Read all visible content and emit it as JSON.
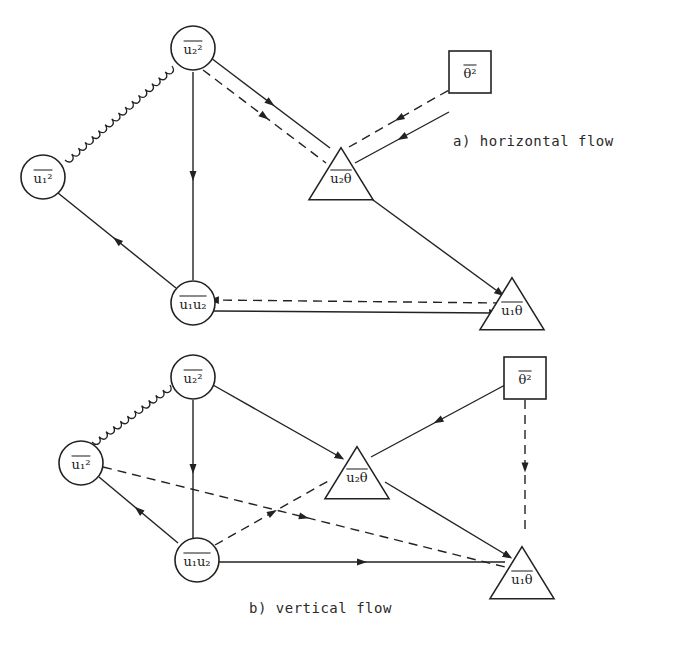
{
  "diagrams": [
    {
      "id": "a",
      "caption": "a) horizontal flow",
      "nodes": [
        {
          "key": "u2sq",
          "shape": "circle",
          "label": "u",
          "sub": "2",
          "sup": "2",
          "x": 193,
          "y": 48
        },
        {
          "key": "u1sq",
          "shape": "circle",
          "label": "u",
          "sub": "1",
          "sup": "2",
          "x": 43,
          "y": 177
        },
        {
          "key": "u1u2",
          "shape": "circle",
          "label": "u₁u₂",
          "sub": "",
          "sup": "",
          "x": 193,
          "y": 303
        },
        {
          "key": "u2theta",
          "shape": "triangle",
          "label": "u₂θ",
          "sub": "",
          "sup": "",
          "x": 341,
          "y": 173
        },
        {
          "key": "u1theta",
          "shape": "triangle",
          "label": "u₁θ",
          "sub": "",
          "sup": "",
          "x": 512,
          "y": 303
        },
        {
          "key": "thetasq",
          "shape": "square",
          "label": "θ",
          "sub": "",
          "sup": "2",
          "x": 470,
          "y": 72
        }
      ]
    },
    {
      "id": "b",
      "caption": "b) vertical flow",
      "nodes": [
        {
          "key": "u2sq",
          "shape": "circle",
          "label": "u",
          "sub": "2",
          "sup": "2",
          "x": 193,
          "y": 377
        },
        {
          "key": "u1sq",
          "shape": "circle",
          "label": "u",
          "sub": "1",
          "sup": "2",
          "x": 81,
          "y": 463
        },
        {
          "key": "u1u2",
          "shape": "circle",
          "label": "u₁u₂",
          "sub": "",
          "sup": "",
          "x": 197,
          "y": 560
        },
        {
          "key": "u2theta",
          "shape": "triangle",
          "label": "u₂θ",
          "sub": "",
          "sup": "",
          "x": 357,
          "y": 472
        },
        {
          "key": "u1theta",
          "shape": "triangle",
          "label": "u₁θ",
          "sub": "",
          "sup": "",
          "x": 522,
          "y": 572
        },
        {
          "key": "thetasq",
          "shape": "square",
          "label": "θ",
          "sub": "",
          "sup": "2",
          "x": 525,
          "y": 378
        }
      ]
    }
  ],
  "edges_a": [
    {
      "from": [
        65,
        160
      ],
      "to": [
        172,
        66
      ],
      "style": "wavy",
      "arrow": false
    },
    {
      "from": [
        193,
        72
      ],
      "to": [
        193,
        280
      ],
      "style": "solid",
      "arrow": "mid"
    },
    {
      "from": [
        58,
        193
      ],
      "to": [
        176,
        288
      ],
      "style": "solid",
      "arrow": "mid-reverse"
    },
    {
      "from": [
        211,
        58
      ],
      "to": [
        330,
        148
      ],
      "style": "solid",
      "arrow": "mid"
    },
    {
      "from": [
        203,
        70
      ],
      "to": [
        326,
        163
      ],
      "style": "dashed",
      "arrow": "mid"
    },
    {
      "from": [
        349,
        147
      ],
      "to": [
        449,
        90
      ],
      "style": "dashed",
      "arrow": "mid-reverse"
    },
    {
      "from": [
        355,
        163
      ],
      "to": [
        449,
        112
      ],
      "style": "solid",
      "arrow": "mid-reverse"
    },
    {
      "from": [
        358,
        189
      ],
      "to": [
        500,
        293
      ],
      "style": "solid",
      "arrow": "end"
    },
    {
      "from": [
        502,
        303
      ],
      "to": [
        214,
        300
      ],
      "style": "dashed",
      "arrow": "end"
    },
    {
      "from": [
        214,
        311
      ],
      "to": [
        494,
        313
      ],
      "style": "solid",
      "arrow": "end"
    }
  ],
  "edges_b": [
    {
      "from": [
        92,
        442
      ],
      "to": [
        170,
        385
      ],
      "style": "wavy",
      "arrow": false
    },
    {
      "from": [
        193,
        400
      ],
      "to": [
        193,
        538
      ],
      "style": "solid",
      "arrow": "mid"
    },
    {
      "from": [
        99,
        477
      ],
      "to": [
        178,
        543
      ],
      "style": "solid",
      "arrow": "mid-reverse"
    },
    {
      "from": [
        213,
        385
      ],
      "to": [
        340,
        457
      ],
      "style": "solid",
      "arrow": "end"
    },
    {
      "from": [
        103,
        467
      ],
      "to": [
        505,
        567
      ],
      "style": "dashed",
      "arrow": "mid"
    },
    {
      "from": [
        215,
        545
      ],
      "to": [
        330,
        480
      ],
      "style": "dashed",
      "arrow": "mid"
    },
    {
      "from": [
        371,
        457
      ],
      "to": [
        505,
        385
      ],
      "style": "solid",
      "arrow": "mid-reverse"
    },
    {
      "from": [
        525,
        400
      ],
      "to": [
        525,
        535
      ],
      "style": "dashed",
      "arrow": "mid"
    },
    {
      "from": [
        385,
        482
      ],
      "to": [
        508,
        556
      ],
      "style": "solid",
      "arrow": "end"
    },
    {
      "from": [
        219,
        562
      ],
      "to": [
        505,
        562
      ],
      "style": "solid",
      "arrow": "mid"
    }
  ],
  "captions": {
    "a": "a) horizontal flow",
    "b": "b) vertical flow"
  },
  "labels": {
    "a_u2sq": "u̅₂²",
    "a_u1sq": "u̅₁²",
    "a_u1u2": "u₁u₂",
    "a_u2theta": "u₂θ",
    "a_u1theta": "u₁θ",
    "a_thetasq": "θ²",
    "b_u2sq": "u₂²",
    "b_u1sq": "u₁²",
    "b_u1u2": "u₁u₂",
    "b_u2theta": "u₂θ",
    "b_u1theta": "u₁θ",
    "b_thetasq": "θ²"
  },
  "colors": {
    "ink": "#222222",
    "background": "#ffffff"
  }
}
